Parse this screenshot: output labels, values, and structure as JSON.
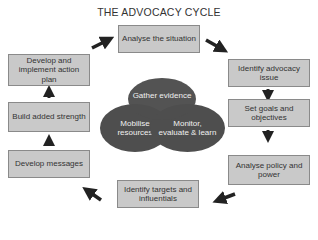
{
  "title": "THE ADVOCACY CYCLE",
  "steps": [
    {
      "label": "Analyse the situation"
    },
    {
      "label": "Identify advocacy issue"
    },
    {
      "label": "Set goals and objectives"
    },
    {
      "label": "Analyse policy and power"
    },
    {
      "label": "Identify targets and influentials"
    },
    {
      "label": "Develop messages"
    },
    {
      "label": "Build added strength"
    },
    {
      "label": "Develop and implement action plan"
    }
  ],
  "center": [
    {
      "label": "Gather evidence"
    },
    {
      "label": "Mobilise resources"
    },
    {
      "label": "Monitor, evaluate & learn"
    }
  ],
  "colors": {
    "box_fill": "#c9c9c9",
    "box_border": "#8a8a8a",
    "ellipse_fill": "#4e4e4e",
    "arrow": "#222222"
  }
}
